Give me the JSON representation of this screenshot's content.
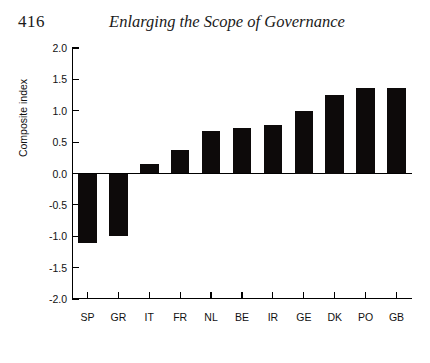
{
  "page": {
    "folio": "416",
    "running_head": "Enlarging the Scope of Governance"
  },
  "chart_data": {
    "type": "bar",
    "title": "",
    "xlabel": "",
    "ylabel": "Composite index",
    "categories": [
      "SP",
      "GR",
      "IT",
      "FR",
      "NL",
      "BE",
      "IR",
      "GE",
      "DK",
      "PO",
      "GB"
    ],
    "values": [
      -1.1,
      -1.0,
      0.15,
      0.38,
      0.67,
      0.73,
      0.78,
      1.0,
      1.25,
      1.37,
      1.37
    ],
    "ylim": [
      -2.0,
      2.0
    ],
    "ytick_labels": [
      "2.0",
      "1.5",
      "1.0",
      "0.5",
      "0.0",
      "-0.5",
      "-1.0",
      "-1.5",
      "-2.0"
    ],
    "ytick_values": [
      2.0,
      1.5,
      1.0,
      0.5,
      0.0,
      -0.5,
      -1.0,
      -1.5,
      -2.0
    ],
    "grid": false,
    "legend": null,
    "bar_color": "#0d0a0a",
    "axis_color": "#000000"
  }
}
